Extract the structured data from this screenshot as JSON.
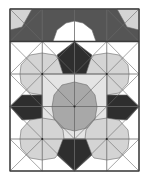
{
  "diagram": {
    "frame": {
      "x": 10,
      "y": 9,
      "w": 129,
      "h": 162
    },
    "grid": {
      "cols": 4,
      "rows": 5,
      "xs": [
        10,
        42.25,
        74.5,
        106.75,
        139
      ],
      "ys": [
        9,
        41.5,
        74,
        106.5,
        139,
        171
      ]
    },
    "colors": {
      "white": "#ffffff",
      "light": "#d4d4d4",
      "lighter": "#e4e4e4",
      "medium": "#a8a8a8",
      "dark": "#555555",
      "darkest": "#2e2e2e",
      "line": "#6a6a6a",
      "frame": "#3a3a3a"
    },
    "shapes": [
      {
        "name": "top-band-background",
        "fill": "dark",
        "points": [
          [
            10,
            9
          ],
          [
            139,
            9
          ],
          [
            139,
            41.5
          ],
          [
            10,
            41.5
          ]
        ]
      },
      {
        "name": "top-left-corner-triangle",
        "fill": "light",
        "points": [
          [
            10,
            9
          ],
          [
            32,
            9
          ],
          [
            22,
            27
          ],
          [
            10,
            30
          ]
        ]
      },
      {
        "name": "top-right-corner-triangle",
        "fill": "light",
        "points": [
          [
            139,
            9
          ],
          [
            117,
            9
          ],
          [
            127,
            27
          ],
          [
            139,
            30
          ]
        ]
      },
      {
        "name": "top-white-half-octagon",
        "fill": "white",
        "points": [
          [
            53,
            41.5
          ],
          [
            57,
            30
          ],
          [
            66,
            23
          ],
          [
            74.5,
            21
          ],
          [
            83,
            23
          ],
          [
            92,
            30
          ],
          [
            96,
            41.5
          ]
        ]
      },
      {
        "name": "top-band-left-gap",
        "fill": "white",
        "points": [
          [
            10,
            41.5
          ],
          [
            10,
            41.5
          ],
          [
            10,
            41.5
          ]
        ]
      },
      {
        "name": "row2-white-bg",
        "fill": "white",
        "points": [
          [
            10,
            41.5
          ],
          [
            139,
            41.5
          ],
          [
            139,
            171
          ],
          [
            10,
            171
          ]
        ]
      },
      {
        "name": "left-octagon-upper",
        "fill": "light",
        "points": [
          [
            30,
            55
          ],
          [
            42,
            53
          ],
          [
            55,
            55
          ],
          [
            63,
            65
          ],
          [
            64,
            74
          ],
          [
            63,
            83
          ],
          [
            55,
            93
          ],
          [
            42,
            95
          ],
          [
            30,
            93
          ],
          [
            21,
            83
          ],
          [
            20,
            74
          ],
          [
            21,
            65
          ]
        ]
      },
      {
        "name": "right-octagon-upper",
        "fill": "light",
        "points": [
          [
            94,
            55
          ],
          [
            107,
            53
          ],
          [
            119,
            55
          ],
          [
            128,
            65
          ],
          [
            129,
            74
          ],
          [
            128,
            83
          ],
          [
            119,
            93
          ],
          [
            107,
            95
          ],
          [
            94,
            93
          ],
          [
            86,
            83
          ],
          [
            85,
            74
          ],
          [
            86,
            65
          ]
        ]
      },
      {
        "name": "center-dark-pentagon-top",
        "fill": "darkest",
        "points": [
          [
            74.5,
            41.5
          ],
          [
            92,
            55
          ],
          [
            86,
            74
          ],
          [
            63,
            74
          ],
          [
            57,
            55
          ]
        ]
      },
      {
        "name": "center-light-band",
        "fill": "lighter",
        "points": [
          [
            42,
            74
          ],
          [
            107,
            74
          ],
          [
            107,
            139
          ],
          [
            42,
            139
          ]
        ]
      },
      {
        "name": "center-medium-octagon",
        "fill": "medium",
        "points": [
          [
            62,
            85
          ],
          [
            74.5,
            82
          ],
          [
            87,
            85
          ],
          [
            95,
            95
          ],
          [
            97,
            107
          ],
          [
            95,
            119
          ],
          [
            87,
            128
          ],
          [
            74.5,
            131
          ],
          [
            62,
            128
          ],
          [
            54,
            119
          ],
          [
            52,
            107
          ],
          [
            54,
            95
          ]
        ]
      },
      {
        "name": "left-dark-pentagon",
        "fill": "darkest",
        "points": [
          [
            10,
            106.5
          ],
          [
            22,
            95
          ],
          [
            42,
            95
          ],
          [
            42,
            119
          ],
          [
            22,
            120
          ]
        ]
      },
      {
        "name": "right-dark-pentagon",
        "fill": "darkest",
        "points": [
          [
            139,
            106.5
          ],
          [
            127,
            95
          ],
          [
            107,
            95
          ],
          [
            107,
            119
          ],
          [
            127,
            120
          ]
        ]
      },
      {
        "name": "left-octagon-lower",
        "fill": "light",
        "points": [
          [
            30,
            120
          ],
          [
            42,
            118
          ],
          [
            55,
            120
          ],
          [
            63,
            130
          ],
          [
            64,
            139
          ],
          [
            63,
            148
          ],
          [
            55,
            158
          ],
          [
            42,
            160
          ],
          [
            30,
            158
          ],
          [
            21,
            148
          ],
          [
            20,
            139
          ],
          [
            21,
            130
          ]
        ]
      },
      {
        "name": "right-octagon-lower",
        "fill": "light",
        "points": [
          [
            94,
            120
          ],
          [
            107,
            118
          ],
          [
            119,
            120
          ],
          [
            128,
            130
          ],
          [
            129,
            139
          ],
          [
            128,
            148
          ],
          [
            119,
            158
          ],
          [
            107,
            160
          ],
          [
            94,
            158
          ],
          [
            86,
            148
          ],
          [
            85,
            139
          ],
          [
            86,
            130
          ]
        ]
      },
      {
        "name": "bottom-dark-pentagon",
        "fill": "darkest",
        "points": [
          [
            63,
            139
          ],
          [
            86,
            139
          ],
          [
            92,
            155
          ],
          [
            74.5,
            171
          ],
          [
            57,
            155
          ]
        ]
      }
    ],
    "lines": [
      [
        10,
        9,
        74.5,
        74
      ],
      [
        139,
        9,
        74.5,
        74
      ],
      [
        42.25,
        9,
        10,
        41.5
      ],
      [
        106.75,
        9,
        139,
        41.5
      ],
      [
        10,
        41.5,
        74.5,
        106.5
      ],
      [
        139,
        41.5,
        74.5,
        106.5
      ],
      [
        10,
        74,
        42.25,
        41.5
      ],
      [
        139,
        74,
        106.75,
        41.5
      ],
      [
        10,
        74,
        74.5,
        139
      ],
      [
        139,
        74,
        74.5,
        139
      ],
      [
        10,
        106.5,
        74.5,
        171
      ],
      [
        139,
        106.5,
        74.5,
        171
      ],
      [
        10,
        139,
        42.25,
        171
      ],
      [
        139,
        139,
        106.75,
        171
      ],
      [
        42.25,
        74,
        10,
        106.5
      ],
      [
        106.75,
        74,
        139,
        106.5
      ],
      [
        42.25,
        139,
        10,
        171
      ],
      [
        106.75,
        139,
        139,
        171
      ],
      [
        74.5,
        41.5,
        42.25,
        74
      ],
      [
        74.5,
        41.5,
        106.75,
        74
      ]
    ],
    "dots": [
      [
        42.25,
        74
      ],
      [
        106.75,
        74
      ],
      [
        74.5,
        106.5
      ],
      [
        42.25,
        139
      ],
      [
        106.75,
        139
      ],
      [
        74.5,
        41.5
      ]
    ]
  }
}
